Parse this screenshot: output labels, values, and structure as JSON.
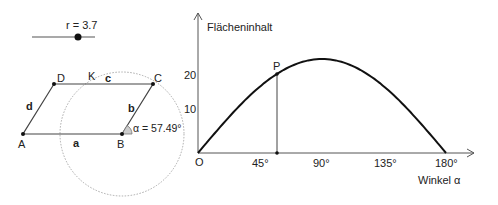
{
  "slider": {
    "label": "r = 3.7",
    "value": 3.7
  },
  "parallelogram": {
    "points": {
      "A": "A",
      "B": "B",
      "C": "C",
      "D": "D",
      "K": "K"
    },
    "sides": {
      "a": "a",
      "b": "b",
      "c": "c",
      "d": "d"
    },
    "angle_label": "α = 57.49°"
  },
  "chart_data": {
    "type": "line",
    "title": "",
    "xlabel": "Winkel α",
    "ylabel": "Flächeninhalt",
    "origin_label": "O",
    "point_label": "P",
    "x_ticks": [
      "45°",
      "90°",
      "135°",
      "180°"
    ],
    "y_ticks": [
      "10",
      "20"
    ],
    "xlim": [
      0,
      180
    ],
    "ylim": [
      0,
      25
    ],
    "series": [
      {
        "name": "Flächeninhalt",
        "function": "A(α) = 24·sin(α)",
        "x": [
          0,
          30,
          45,
          57.49,
          60,
          90,
          120,
          135,
          150,
          180
        ],
        "values": [
          0,
          12,
          17,
          20.2,
          20.8,
          24,
          20.8,
          17,
          12,
          0
        ]
      }
    ],
    "point_P": {
      "x": 57.49,
      "y": 20.2
    }
  }
}
